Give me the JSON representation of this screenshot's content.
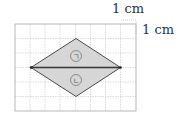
{
  "figure": {
    "scale_label_horizontal": "1 cm",
    "scale_label_vertical": "1 cm",
    "grid": {
      "columns": 8,
      "rows": 6,
      "cell_px": 15
    },
    "shape": "rhombus",
    "shape_vertices_grid": {
      "left": [
        1,
        3
      ],
      "top": [
        4,
        1
      ],
      "right": [
        7,
        3
      ],
      "bottom": [
        4,
        5
      ]
    },
    "regions": [
      {
        "id": "top-triangle",
        "label": "ㄱ"
      },
      {
        "id": "bottom-triangle",
        "label": "ㄴ"
      }
    ],
    "colors": {
      "fill": "#d9d9d9",
      "stroke": "#444444",
      "grid": "#bdbdbd"
    }
  }
}
